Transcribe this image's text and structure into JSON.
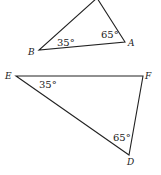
{
  "figures": [
    {
      "name": "triangle-abc",
      "vertices": {
        "top": {
          "x": 97,
          "y": -2,
          "label": ""
        },
        "A": {
          "x": 125,
          "y": 42,
          "label": "A"
        },
        "B": {
          "x": 39,
          "y": 50,
          "label": "B"
        }
      },
      "angles": {
        "B": "35°",
        "A": "65°"
      }
    },
    {
      "name": "triangle-def",
      "vertices": {
        "E": {
          "x": 16,
          "y": 76,
          "label": "E"
        },
        "F": {
          "x": 143,
          "y": 76,
          "label": "F"
        },
        "D": {
          "x": 129,
          "y": 155,
          "label": "D"
        }
      },
      "angles": {
        "E": "35°",
        "D": "65°"
      }
    }
  ],
  "colors": {
    "stroke": "#222222",
    "background": "#ffffff"
  }
}
